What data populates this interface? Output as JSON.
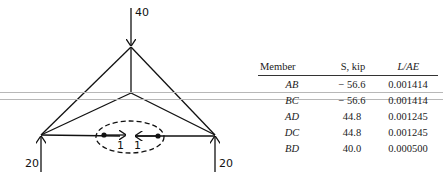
{
  "diagram": {
    "loads": {
      "top": "40",
      "left_reaction": "20",
      "right_reaction": "20"
    },
    "virtual_loads": [
      "1",
      "1"
    ]
  },
  "table": {
    "headers": [
      "Member",
      "S, kip",
      "L/AE"
    ],
    "rows": [
      {
        "member": "AB",
        "s": "− 56.6",
        "lae": "0.001414"
      },
      {
        "member": "BC",
        "s": "− 56.6",
        "lae": "0.001414"
      },
      {
        "member": "AD",
        "s": "44.8",
        "lae": "0.001245"
      },
      {
        "member": "DC",
        "s": "44.8",
        "lae": "0.001245"
      },
      {
        "member": "BD",
        "s": "40.0",
        "lae": "0.000500"
      }
    ]
  }
}
